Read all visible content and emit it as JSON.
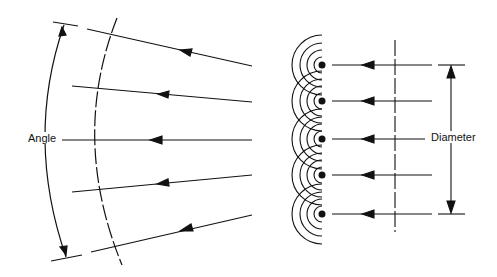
{
  "diagram": {
    "labels": {
      "angle": "Angle",
      "diameter": "Diameter"
    },
    "left_panel": {
      "description": "Converging rays with curved wavefront and angle arc",
      "ray_count": 5
    },
    "right_panel": {
      "description": "Parallel rays arriving at array of point sources with circular wavelets",
      "element_count": 5
    },
    "colors": {
      "line": "#111111",
      "background": "#ffffff"
    }
  }
}
